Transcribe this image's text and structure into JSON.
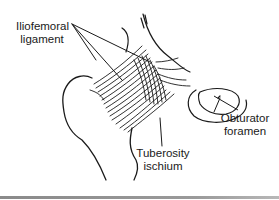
{
  "figure": {
    "labels": {
      "iliofemoral": {
        "line1": "Iliofemoral",
        "line2": "ligament"
      },
      "obturator": {
        "line1": "Obturator",
        "line2": "foramen"
      },
      "tuberosity": {
        "line1": "Tuberosity",
        "line2": "ischium"
      }
    },
    "colors": {
      "ink": "#1a1a1a",
      "background": "#ffffff",
      "bottom_rule": "#8a8a8a"
    }
  }
}
